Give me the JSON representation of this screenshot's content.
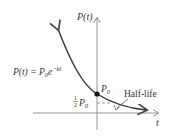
{
  "diagram": {
    "y_axis_label": "P(t)",
    "x_axis_label": "t",
    "formula": {
      "lhs": "P(t) = P",
      "sub": "0",
      "e": "e",
      "exp": "−kt"
    },
    "initial_point": {
      "label": "P",
      "sub": "0"
    },
    "half_point": {
      "frac_num": "1",
      "frac_den": "2",
      "label": "P",
      "sub": "0"
    },
    "half_life_label": "Half-life",
    "colors": {
      "curve": "#333333",
      "axis": "#777777",
      "dashed": "#888888"
    }
  }
}
